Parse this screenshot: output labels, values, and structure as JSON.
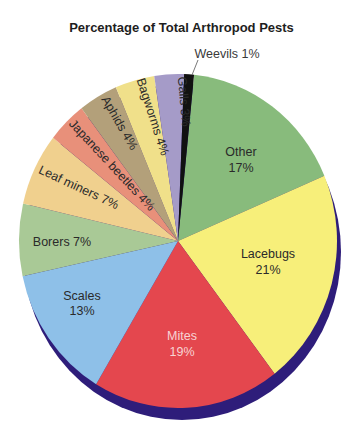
{
  "title": "Percentage of Total Arthropod Pests",
  "chart_data": {
    "type": "pie",
    "title": "Percentage of Total Arthropod Pests",
    "start_angle_deg": 5.8,
    "direction": "clockwise",
    "slices": [
      {
        "label": "Other",
        "value": 17,
        "display": "Other 17%",
        "color": "#88bb7c"
      },
      {
        "label": "Lacebugs",
        "value": 21,
        "display": "Lacebugs 21%",
        "color": "#f7ef7a"
      },
      {
        "label": "Mites",
        "value": 19,
        "display": "Mites 19%",
        "color": "#e4474e"
      },
      {
        "label": "Scales",
        "value": 13,
        "display": "Scales 13%",
        "color": "#8ec0e8"
      },
      {
        "label": "Borers",
        "value": 7,
        "display": "Borers 7%",
        "color": "#a9c996"
      },
      {
        "label": "Leaf miners",
        "value": 7,
        "display": "Leaf miners 7%",
        "color": "#f0d08e"
      },
      {
        "label": "Japanese beetles",
        "value": 4,
        "display": "Japanese beetles 4%",
        "color": "#e8907a"
      },
      {
        "label": "Aphids",
        "value": 4,
        "display": "Aphids 4%",
        "color": "#b3a07a"
      },
      {
        "label": "Bagworms",
        "value": 4,
        "display": "Bagworms 4%",
        "color": "#f0e08a"
      },
      {
        "label": "Galls",
        "value": 3,
        "display": "Galls 3%",
        "color": "#a59bc8"
      },
      {
        "label": "Weevils",
        "value": 1,
        "display": "Weevils 1%",
        "color": "#111111"
      }
    ],
    "shadow_color": "#2e1d7a"
  },
  "labels": {
    "other": {
      "name": "Other",
      "pct": "17%"
    },
    "lacebugs": {
      "name": "Lacebugs",
      "pct": "21%"
    },
    "mites": {
      "name": "Mites",
      "pct": "19%"
    },
    "scales": {
      "name": "Scales",
      "pct": "13%"
    },
    "borers": "Borers 7%",
    "leaf_miners": "Leaf miners 7%",
    "japanese_beetles": "Japanese beetles 4%",
    "aphids": "Aphids 4%",
    "bagworms": "Bagworms 4%",
    "galls": "Galls 3%",
    "weevils": "Weevils 1%"
  }
}
